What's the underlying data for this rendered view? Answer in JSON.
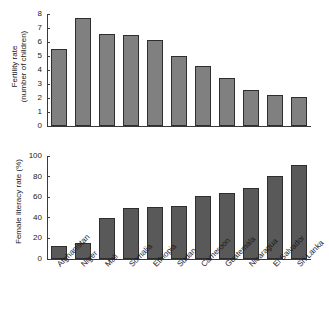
{
  "chart_data": [
    {
      "type": "bar",
      "id": "fertility",
      "title": "",
      "xlabel": "",
      "ylabel": "Fertility rate\n(number of children)",
      "ylabel_line1": "Fertility rate",
      "ylabel_line2": "(number of children)",
      "unit": "children per woman",
      "categories": [
        "Afghanistan",
        "Niger",
        "Mali",
        "Somalia",
        "Ethiopia",
        "Sudan",
        "Cameroon",
        "Guatemala",
        "Nicaragua",
        "El Salvador",
        "Sri Lanka"
      ],
      "values": [
        5.5,
        7.75,
        6.6,
        6.5,
        6.15,
        5.0,
        4.3,
        3.45,
        2.6,
        2.25,
        2.1
      ],
      "ylim": [
        0,
        8
      ],
      "yticks": [
        0,
        1,
        2,
        3,
        4,
        5,
        6,
        7,
        8
      ],
      "ytick_labels": [
        "0",
        "1",
        "2",
        "3",
        "4",
        "5",
        "6",
        "7",
        "8"
      ],
      "grid": false,
      "legend": false,
      "bar_color": "#808080",
      "bar_edge_color": "#2e2e2e",
      "x_tick_labels_visible": false
    },
    {
      "type": "bar",
      "id": "literacy",
      "title": "",
      "xlabel": "",
      "ylabel": "Female literacy rate (%)",
      "unit": "%",
      "categories": [
        "Afghanistan",
        "Niger",
        "Mali",
        "Somalia",
        "Ethiopia",
        "Sudan",
        "Cameroon",
        "Guatemala",
        "Nicaragua",
        "El Salvador",
        "Sri Lanka"
      ],
      "values": [
        13,
        15.5,
        40,
        50,
        50.5,
        51,
        61,
        64.5,
        69,
        81,
        91
      ],
      "ylim": [
        0,
        100
      ],
      "yticks": [
        0,
        20,
        40,
        60,
        80,
        100
      ],
      "ytick_labels": [
        "0",
        "20",
        "40",
        "60",
        "80",
        "100"
      ],
      "grid": false,
      "legend": false,
      "bar_color": "#595959",
      "bar_edge_color": "#2e2e2e",
      "x_tick_labels_visible": true,
      "x_tick_label_rotation": -45
    }
  ],
  "figure": {
    "background": "#ffffff",
    "panel_count": 2
  }
}
